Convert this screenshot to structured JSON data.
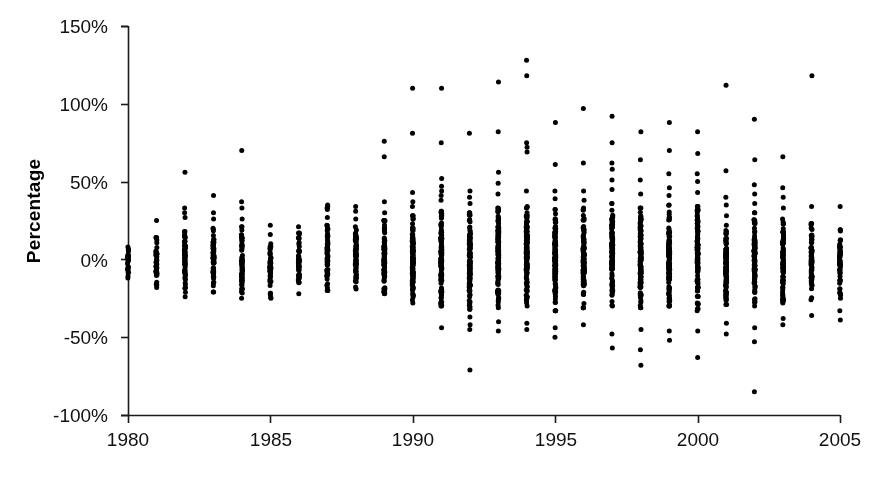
{
  "chart_data": {
    "type": "scatter",
    "title": "",
    "xlabel": "",
    "ylabel": "Percentage",
    "xlim": [
      1980,
      2005
    ],
    "ylim": [
      -100,
      150
    ],
    "grid": false,
    "legend": "none",
    "marker": "filled-circle",
    "marker_color": "#000000",
    "marker_size_px": 5,
    "x_ticks": [
      1980,
      1985,
      1990,
      1995,
      2000,
      2005
    ],
    "x_tick_labels": [
      "1980",
      "1985",
      "1990",
      "1995",
      "2000",
      "2005"
    ],
    "y_ticks": [
      -100,
      -50,
      0,
      50,
      100,
      150
    ],
    "y_tick_labels": [
      "-100%",
      "-50%",
      "0%",
      "50%",
      "100%",
      "150%"
    ],
    "series": [
      {
        "name": "Percentage by year",
        "columns": [
          {
            "x": 1980,
            "count": 24,
            "min": -14,
            "max": 11,
            "core_low": -12,
            "core_high": 8,
            "outliers": []
          },
          {
            "x": 1981,
            "count": 40,
            "min": -19,
            "max": 25,
            "core_low": -18,
            "core_high": 14,
            "outliers": [
              25
            ]
          },
          {
            "x": 1982,
            "count": 58,
            "min": -28,
            "max": 56,
            "core_low": -24,
            "core_high": 18,
            "outliers": [
              56,
              33,
              30,
              27
            ]
          },
          {
            "x": 1983,
            "count": 58,
            "min": -23,
            "max": 41,
            "core_low": -21,
            "core_high": 20,
            "outliers": [
              41,
              30,
              26
            ]
          },
          {
            "x": 1984,
            "count": 62,
            "min": -29,
            "max": 70,
            "core_low": -25,
            "core_high": 21,
            "outliers": [
              70,
              37,
              33,
              26
            ]
          },
          {
            "x": 1985,
            "count": 48,
            "min": -26,
            "max": 22,
            "core_low": -25,
            "core_high": 16,
            "outliers": [
              22
            ]
          },
          {
            "x": 1986,
            "count": 52,
            "min": -24,
            "max": 21,
            "core_low": -22,
            "core_high": 17,
            "outliers": [
              21
            ]
          },
          {
            "x": 1987,
            "count": 66,
            "min": -23,
            "max": 35,
            "core_low": -20,
            "core_high": 22,
            "outliers": [
              35,
              34,
              33,
              32,
              27
            ]
          },
          {
            "x": 1988,
            "count": 70,
            "min": -21,
            "max": 34,
            "core_low": -19,
            "core_high": 21,
            "outliers": [
              34,
              31,
              26
            ]
          },
          {
            "x": 1989,
            "count": 76,
            "min": -25,
            "max": 76,
            "core_low": -22,
            "core_high": 25,
            "outliers": [
              76,
              66,
              37,
              30
            ]
          },
          {
            "x": 1990,
            "count": 118,
            "min": -31,
            "max": 110,
            "core_low": -28,
            "core_high": 28,
            "outliers": [
              110,
              81,
              43,
              37,
              34
            ]
          },
          {
            "x": 1991,
            "count": 126,
            "min": -44,
            "max": 110,
            "core_low": -30,
            "core_high": 31,
            "outliers": [
              110,
              75,
              52,
              47,
              44,
              41,
              38,
              -44
            ]
          },
          {
            "x": 1992,
            "count": 132,
            "min": -71,
            "max": 81,
            "core_low": -32,
            "core_high": 30,
            "outliers": [
              81,
              44,
              40,
              36,
              -37,
              -42,
              -45,
              -71
            ]
          },
          {
            "x": 1993,
            "count": 136,
            "min": -46,
            "max": 114,
            "core_low": -31,
            "core_high": 33,
            "outliers": [
              114,
              82,
              56,
              49,
              42,
              -40,
              -46
            ]
          },
          {
            "x": 1994,
            "count": 138,
            "min": -45,
            "max": 128,
            "core_low": -30,
            "core_high": 34,
            "outliers": [
              128,
              118,
              75,
              72,
              69,
              44,
              -41,
              -45
            ]
          },
          {
            "x": 1995,
            "count": 134,
            "min": -50,
            "max": 88,
            "core_low": -33,
            "core_high": 32,
            "outliers": [
              88,
              61,
              44,
              39,
              -44,
              -50
            ]
          },
          {
            "x": 1996,
            "count": 130,
            "min": -42,
            "max": 97,
            "core_low": -31,
            "core_high": 33,
            "outliers": [
              97,
              62,
              44,
              38,
              -42
            ]
          },
          {
            "x": 1997,
            "count": 128,
            "min": -57,
            "max": 92,
            "core_low": -30,
            "core_high": 36,
            "outliers": [
              92,
              75,
              62,
              58,
              51,
              45,
              -48,
              -57
            ]
          },
          {
            "x": 1998,
            "count": 126,
            "min": -68,
            "max": 82,
            "core_low": -31,
            "core_high": 33,
            "outliers": [
              82,
              64,
              51,
              42,
              -45,
              -58,
              -68
            ]
          },
          {
            "x": 1999,
            "count": 120,
            "min": -52,
            "max": 88,
            "core_low": -30,
            "core_high": 35,
            "outliers": [
              88,
              70,
              55,
              46,
              41,
              -46,
              -52
            ]
          },
          {
            "x": 2000,
            "count": 116,
            "min": -63,
            "max": 82,
            "core_low": -33,
            "core_high": 34,
            "outliers": [
              82,
              68,
              55,
              50,
              43,
              -46,
              -63
            ]
          },
          {
            "x": 2001,
            "count": 104,
            "min": -48,
            "max": 112,
            "core_low": -29,
            "core_high": 28,
            "outliers": [
              112,
              57,
              40,
              35,
              -41,
              -48
            ]
          },
          {
            "x": 2002,
            "count": 98,
            "min": -85,
            "max": 90,
            "core_low": -30,
            "core_high": 30,
            "outliers": [
              90,
              64,
              48,
              42,
              36,
              -44,
              -53,
              -85
            ]
          },
          {
            "x": 2003,
            "count": 88,
            "min": -42,
            "max": 66,
            "core_low": -28,
            "core_high": 26,
            "outliers": [
              66,
              46,
              40,
              33,
              -38,
              -42
            ]
          },
          {
            "x": 2004,
            "count": 72,
            "min": -36,
            "max": 118,
            "core_low": -26,
            "core_high": 23,
            "outliers": [
              118,
              34,
              -36
            ]
          },
          {
            "x": 2005,
            "count": 58,
            "min": -39,
            "max": 34,
            "core_low": -25,
            "core_high": 19,
            "outliers": [
              34,
              -33,
              -39
            ]
          }
        ]
      }
    ]
  },
  "axes": {
    "y_title": "Percentage",
    "y_tick_labels": [
      "150%",
      "100%",
      "50%",
      "0%",
      "-50%",
      "-100%"
    ],
    "x_tick_labels": [
      "1980",
      "1985",
      "1990",
      "1995",
      "2000",
      "2005"
    ]
  }
}
